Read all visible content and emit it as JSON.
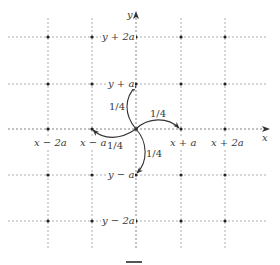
{
  "diagram": {
    "type": "random-walk-lattice",
    "axes": {
      "x_label": "x",
      "y_label": "y"
    },
    "x_tick_labels": [
      "x − 2a",
      "x − a",
      "x + a",
      "x + 2a"
    ],
    "y_tick_labels": [
      "y + 2a",
      "y + a",
      "y − a",
      "y − 2a"
    ],
    "transitions": [
      {
        "to": "y + a",
        "probability": "1/4"
      },
      {
        "to": "x + a",
        "probability": "1/4"
      },
      {
        "to": "x − a",
        "probability": "1/4"
      },
      {
        "to": "y − a",
        "probability": "1/4"
      }
    ],
    "colors": {
      "grid": "#9a9a9a",
      "node": "#222222",
      "arrow": "#333333",
      "text": "#3a3a3a"
    }
  }
}
